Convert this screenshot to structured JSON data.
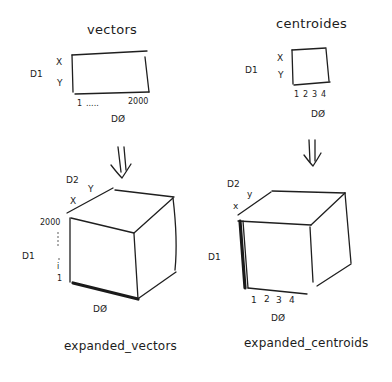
{
  "diagram": {
    "left": {
      "title": "vectors",
      "matrix": {
        "row_axis_label": "D1",
        "rows": [
          "X",
          "Y"
        ],
        "col_axis_label": "DØ",
        "col_start": "1",
        "col_ellipsis": ".....",
        "col_end": "2000"
      },
      "arrow": "⇓",
      "cube": {
        "depth_axis_label": "D2",
        "depth_labels": [
          "X",
          "Y"
        ],
        "row_axis_label": "D1",
        "row_top": "2000",
        "row_ellipsis": "⋮",
        "row_mid": "i",
        "row_bottom": "1",
        "col_axis_label": "DØ"
      },
      "caption": "expanded_vectors"
    },
    "right": {
      "title": "centroides",
      "matrix": {
        "row_axis_label": "D1",
        "rows": [
          "X",
          "Y"
        ],
        "col_axis_label": "DØ",
        "cols": [
          "1",
          "2",
          "3",
          "4"
        ]
      },
      "arrow": "⇓",
      "cube": {
        "depth_axis_label": "D2",
        "depth_labels": [
          "x",
          "y"
        ],
        "row_axis_label": "D1",
        "cols": [
          "1",
          "2",
          "3",
          "4"
        ],
        "col_axis_label": "DØ"
      },
      "caption": "expanded_centroids"
    },
    "colors": {
      "ink": "#1f1f1f",
      "background": "#ffffff"
    }
  }
}
